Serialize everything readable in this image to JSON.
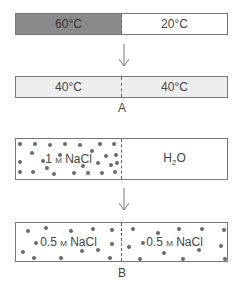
{
  "panel_a": {
    "before": {
      "left": "60°C",
      "right": "20°C",
      "left_color": "#8a8a8a",
      "right_color": "#ffffff"
    },
    "after": {
      "left": "40°C",
      "right": "40°C",
      "color": "#eeeeee"
    },
    "label": "A"
  },
  "panel_b": {
    "before": {
      "left_num": "1",
      "left_unit": "M",
      "left_solute": "NaCl",
      "right_h": "H",
      "right_sub": "2",
      "right_o": "O"
    },
    "after": {
      "left_num": "0.5",
      "left_unit": "M",
      "left_solute": "NaCl",
      "right_num": "0.5",
      "right_unit": "M",
      "right_solute": "NaCl"
    },
    "label": "B"
  }
}
